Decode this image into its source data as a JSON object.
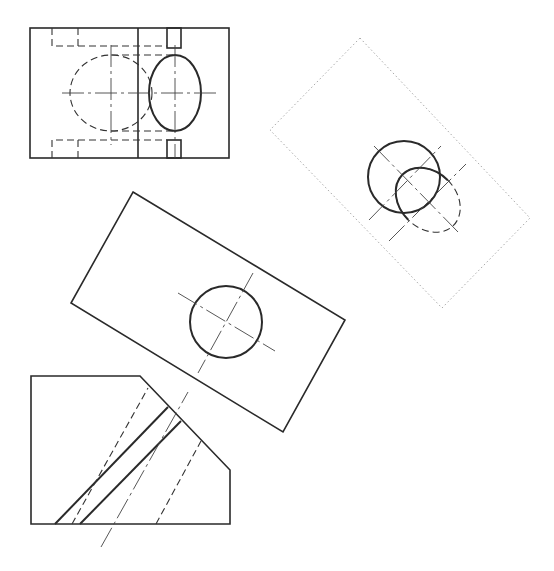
{
  "drawing": {
    "type": "orthographic-projection-with-auxiliary-views",
    "stroke_color": "#2a2a2a",
    "construction_color": "#aaaaaa",
    "views": [
      {
        "name": "front-view",
        "label": ""
      },
      {
        "name": "auxiliary-view-dotted",
        "label": ""
      },
      {
        "name": "auxiliary-view-plate",
        "label": ""
      },
      {
        "name": "side-view-chamfered",
        "label": ""
      }
    ]
  }
}
